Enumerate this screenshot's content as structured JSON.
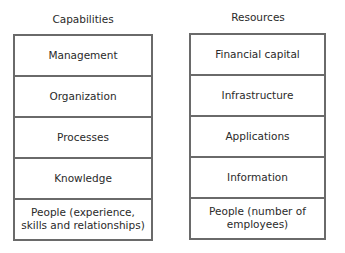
{
  "columns": [
    {
      "title": "Capabilities",
      "items": [
        "Management",
        "Organization",
        "Processes",
        "Knowledge",
        "People (experience, skills and relationships)"
      ]
    },
    {
      "title": "Resources",
      "items": [
        "Financial capital",
        "Infrastructure",
        "Applications",
        "Information",
        "People (number of employees)"
      ]
    }
  ],
  "colors": {
    "border": "#6a6a6a",
    "text": "#2a2a2a",
    "background": "#ffffff"
  }
}
